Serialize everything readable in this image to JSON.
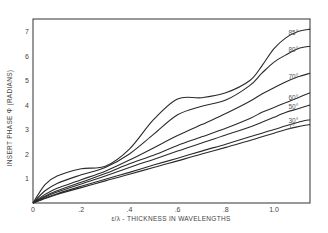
{
  "chart_data": {
    "type": "line",
    "title": "",
    "xlabel": "ε/λ - THICKNESS IN WAVELENGTHS",
    "ylabel": "INSERT PHASE Φ (RADIANS)",
    "xlim": [
      0,
      1.15
    ],
    "ylim": [
      0,
      7.2
    ],
    "grid": false,
    "legend_position": "inline-right",
    "x_ticks": [
      {
        "value": 0,
        "label": "0"
      },
      {
        "value": 0.2,
        "label": ".2"
      },
      {
        "value": 0.4,
        "label": ".4"
      },
      {
        "value": 0.6,
        "label": ".6"
      },
      {
        "value": 0.8,
        "label": ".8"
      },
      {
        "value": 1.0,
        "label": "1.0"
      }
    ],
    "y_ticks": [
      {
        "value": 1,
        "label": "1"
      },
      {
        "value": 2,
        "label": "2"
      },
      {
        "value": 3,
        "label": "3"
      },
      {
        "value": 4,
        "label": "4"
      },
      {
        "value": 5,
        "label": "5"
      },
      {
        "value": 6,
        "label": "6"
      },
      {
        "value": 7,
        "label": "7"
      }
    ],
    "x": [
      0,
      0.05,
      0.1,
      0.2,
      0.3,
      0.4,
      0.5,
      0.6,
      0.7,
      0.8,
      0.9,
      0.95,
      1.0,
      1.05,
      1.1,
      1.15
    ],
    "series": [
      {
        "name": "85°",
        "label": "85°",
        "values": [
          0,
          0.75,
          1.1,
          1.4,
          1.5,
          2.2,
          3.4,
          4.25,
          4.3,
          4.5,
          5.0,
          5.6,
          6.3,
          6.75,
          7.0,
          7.1
        ]
      },
      {
        "name": "80°",
        "label": "80°",
        "values": [
          0,
          0.5,
          0.8,
          1.15,
          1.45,
          2.0,
          2.8,
          3.6,
          3.95,
          4.2,
          4.8,
          5.3,
          5.75,
          6.05,
          6.3,
          6.4
        ]
      },
      {
        "name": "70°",
        "label": "70°",
        "values": [
          0,
          0.35,
          0.6,
          0.95,
          1.3,
          1.75,
          2.25,
          2.75,
          3.2,
          3.65,
          4.15,
          4.45,
          4.7,
          4.95,
          5.15,
          5.3
        ]
      },
      {
        "name": "60°",
        "label": "60°",
        "values": [
          0,
          0.28,
          0.5,
          0.85,
          1.2,
          1.6,
          1.95,
          2.35,
          2.7,
          3.05,
          3.45,
          3.7,
          3.9,
          4.1,
          4.3,
          4.5
        ]
      },
      {
        "name": "50°",
        "label": "50°",
        "values": [
          0,
          0.25,
          0.45,
          0.78,
          1.1,
          1.45,
          1.78,
          2.12,
          2.45,
          2.78,
          3.1,
          3.3,
          3.5,
          3.7,
          3.85,
          4.0
        ]
      },
      {
        "name": "30°",
        "label": "30°",
        "values": [
          0,
          0.2,
          0.38,
          0.68,
          0.97,
          1.25,
          1.55,
          1.83,
          2.12,
          2.4,
          2.7,
          2.85,
          3.0,
          3.15,
          3.3,
          3.4
        ]
      },
      {
        "name": "1°",
        "label": "1°",
        "values": [
          0,
          0.18,
          0.35,
          0.63,
          0.9,
          1.17,
          1.45,
          1.72,
          2.0,
          2.27,
          2.55,
          2.7,
          2.85,
          3.0,
          3.12,
          3.2
        ]
      }
    ]
  }
}
